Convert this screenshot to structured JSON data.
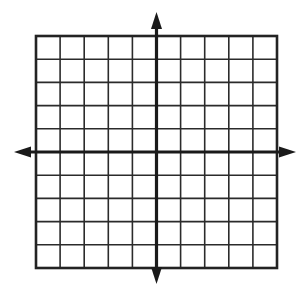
{
  "figure": {
    "background_color": "#ffffff",
    "grid_line_color": "#2b2b2b",
    "axis_color": "#1a1a1a",
    "border_color": "#232323"
  },
  "chart_data": {
    "type": "scatter",
    "title": "",
    "subtitle": "",
    "xlabel": "",
    "ylabel": "",
    "grid": true,
    "legend": null,
    "legend_position": "none",
    "x_axis_visible": true,
    "y_axis_visible": true,
    "x_arrowheads": [
      "left",
      "right"
    ],
    "y_arrowheads": [
      "up",
      "down"
    ],
    "columns": 10,
    "rows": 10,
    "xlim": [
      -5,
      5
    ],
    "ylim": [
      -5,
      5
    ],
    "xticks": [
      -5,
      -4,
      -3,
      -2,
      -1,
      0,
      1,
      2,
      3,
      4,
      5
    ],
    "yticks": [
      -5,
      -4,
      -3,
      -2,
      -1,
      0,
      1,
      2,
      3,
      4,
      5
    ],
    "xticklabels": [],
    "yticklabels": [],
    "tick_step": 1,
    "series": [],
    "annotations": [],
    "data_points": []
  },
  "geometry": {
    "grid_left": 36,
    "grid_right": 277,
    "grid_top": 36,
    "grid_bottom": 268,
    "origin_x": 156.5,
    "origin_y": 152,
    "arrow_up_tip_y": 12,
    "arrow_down_tip_y": 284,
    "arrow_left_tip_x": 14,
    "arrow_right_tip_x": 296
  }
}
